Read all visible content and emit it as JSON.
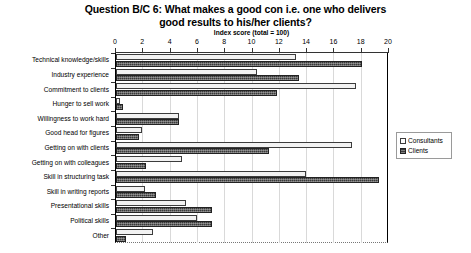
{
  "chart_data": {
    "type": "bar",
    "orientation": "horizontal",
    "title": "Question B/C 6: What makes a good con i.e. one who delivers good results to his/her clients?",
    "title_lines": [
      "Question B/C 6: What makes a good con i.e. one who delivers",
      "good results to his/her clients?"
    ],
    "subtitle": "Index score (total = 100)",
    "xlabel": "Index score (total = 100)",
    "ylabel": "",
    "xlim": [
      0,
      20
    ],
    "xticks": [
      0,
      2,
      4,
      6,
      8,
      10,
      12,
      14,
      16,
      18,
      20
    ],
    "xtick_labels": [
      "0",
      "2",
      "4",
      "6",
      "8",
      "10",
      "12",
      "14",
      "16",
      "18",
      "20"
    ],
    "grid": true,
    "legend_position": "right",
    "categories": [
      "Technical knowledge/skills",
      "Industry experience",
      "Commitment to clients",
      "Hunger to sell work",
      "Willingness to work hard",
      "Good head for figures",
      "Getting on with clients",
      "Getting on with colleagues",
      "Skill in structuring task",
      "Skill in writing reports",
      "Presentational skills",
      "Political skills",
      "Other"
    ],
    "series": [
      {
        "name": "Consultants",
        "color": "#f2f2f2",
        "values": [
          13.2,
          10.3,
          17.6,
          0.3,
          4.6,
          1.9,
          17.3,
          4.8,
          13.9,
          2.1,
          5.1,
          5.9,
          2.7
        ]
      },
      {
        "name": "Clients",
        "color": "#3a3a3a",
        "values": [
          18.0,
          13.4,
          11.8,
          0.5,
          4.6,
          1.7,
          11.2,
          2.2,
          19.3,
          2.9,
          7.0,
          7.0,
          0.7
        ]
      }
    ]
  },
  "legend": {
    "items": [
      {
        "label": "Consultants",
        "swatch": "consultants"
      },
      {
        "label": "Clients",
        "swatch": "clients"
      }
    ]
  }
}
